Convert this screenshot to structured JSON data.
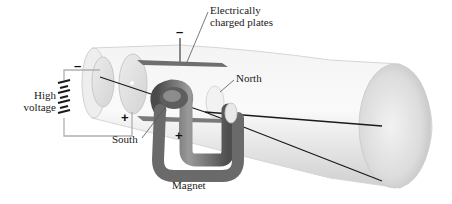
{
  "diagram": {
    "type": "cathode-ray-tube-apparatus",
    "labels": {
      "plates": "Electrically\ncharged plates",
      "plates_line1": "Electrically",
      "plates_line2": "charged plates",
      "north": "North",
      "south": "South",
      "magnet": "Magnet",
      "high_voltage_line1": "High",
      "high_voltage_line2": "voltage"
    },
    "signs": {
      "top_plate": "–",
      "bottom_plate": "+",
      "cathode": "–",
      "anode": "+"
    },
    "colors": {
      "tube": "#e6e6e6",
      "tube_shadow": "#c8c8c8",
      "magnet": "#7a7a7a",
      "beam": "#1a1a1a",
      "wire": "#b0b0b0",
      "plate": "#6e6e6e"
    }
  }
}
